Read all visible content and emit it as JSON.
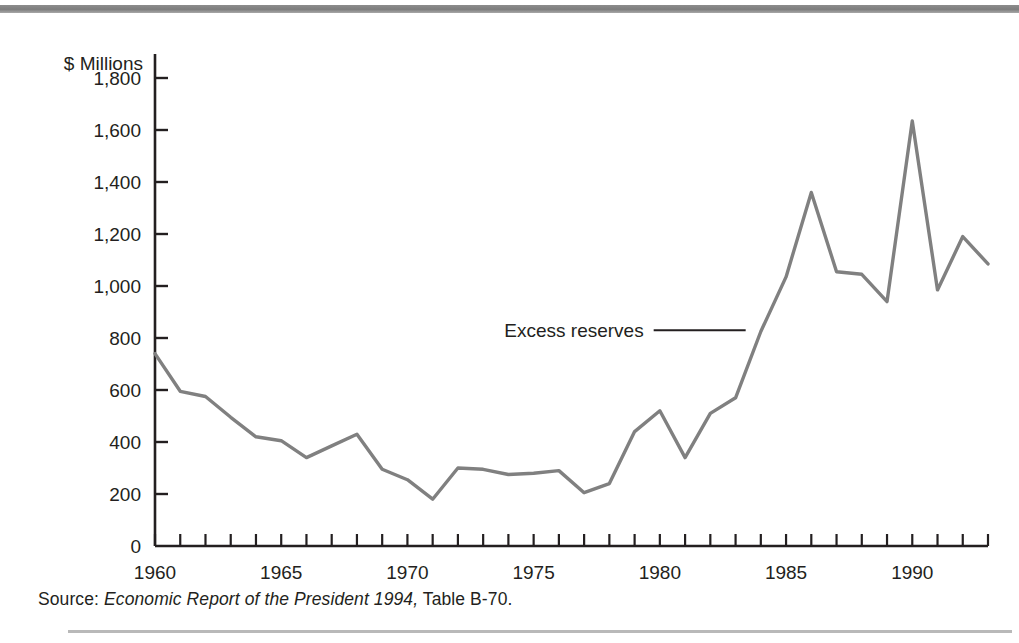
{
  "figure": {
    "unit_label": "$ Millions",
    "source": {
      "label": "Source:",
      "title": "Economic Report of the President 1994,",
      "tail": "Table B-70."
    }
  },
  "chart_data": {
    "type": "line",
    "title": "",
    "subtitle": "",
    "xlabel": "",
    "ylabel": "$ Millions",
    "ylim": [
      0,
      1900
    ],
    "xlim": [
      1960,
      1993
    ],
    "grid": false,
    "legend_position": "inline-annotation",
    "y_ticks": [
      0,
      200,
      400,
      600,
      800,
      1000,
      1200,
      1400,
      1600,
      1800
    ],
    "y_tick_labels": [
      "0",
      "200",
      "400",
      "600",
      "800",
      "1,000",
      "1,200",
      "1,400",
      "1,600",
      "1,800"
    ],
    "x_ticks": [
      1960,
      1965,
      1970,
      1975,
      1980,
      1985,
      1990
    ],
    "x_tick_labels": [
      "1960",
      "1965",
      "1970",
      "1975",
      "1980",
      "1985",
      "1990"
    ],
    "x_minor_ticks": [
      1961,
      1962,
      1963,
      1964,
      1966,
      1967,
      1968,
      1969,
      1971,
      1972,
      1973,
      1974,
      1976,
      1977,
      1978,
      1979,
      1981,
      1982,
      1983,
      1984,
      1986,
      1987,
      1988,
      1989,
      1991,
      1992,
      1993
    ],
    "annotations": [
      {
        "text": "Excess reserves",
        "points_to_year": 1983.4,
        "points_to_value": 830
      }
    ],
    "series": [
      {
        "name": "Excess reserves",
        "color": "#808080",
        "x": [
          1960,
          1961,
          1962,
          1963,
          1964,
          1965,
          1966,
          1967,
          1968,
          1969,
          1970,
          1971,
          1972,
          1973,
          1974,
          1975,
          1976,
          1977,
          1978,
          1979,
          1980,
          1981,
          1982,
          1983,
          1984,
          1985,
          1986,
          1987,
          1988,
          1989,
          1990,
          1991,
          1992,
          1993
        ],
        "values": [
          740,
          595,
          575,
          495,
          420,
          405,
          340,
          385,
          430,
          295,
          255,
          180,
          300,
          295,
          275,
          280,
          290,
          205,
          240,
          440,
          520,
          340,
          510,
          570,
          825,
          1035,
          1360,
          1055,
          1045,
          940,
          1635,
          985,
          1190,
          1085
        ]
      }
    ]
  }
}
